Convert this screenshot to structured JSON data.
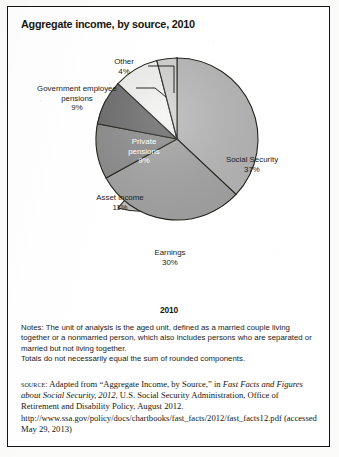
{
  "figure": {
    "title": "Aggregate income, by source, 2010",
    "year_caption": "2010"
  },
  "chart_data": {
    "type": "pie",
    "title": "Aggregate income, by source, 2010",
    "xlabel": "",
    "ylabel": "",
    "legend_position": "none",
    "grid": false,
    "unit": "percent",
    "categories": [
      "Social Security",
      "Earnings",
      "Asset income",
      "Private pensions",
      "Government employee pensions",
      "Other"
    ],
    "values": [
      37,
      30,
      11,
      9,
      9,
      4
    ],
    "slices": [
      {
        "label": "Social Security",
        "value": 37,
        "value_text": "37%",
        "label_line1": "Social Security",
        "label_line2": "37%",
        "label_placement": "inside",
        "color": "#b9b9b9",
        "text_color": "#1c1c18",
        "start_deg": 0,
        "end_deg": 133.2
      },
      {
        "label": "Earnings",
        "value": 30,
        "value_text": "30%",
        "label_line1": "Earnings",
        "label_line2": "30%",
        "label_placement": "inside",
        "color": "#a6a6a6",
        "text_color": "#1c1c18",
        "start_deg": 133.2,
        "end_deg": 241.2
      },
      {
        "label": "Asset income",
        "value": 11,
        "value_text": "11%",
        "label_line1": "Asset income",
        "label_line2": "11%",
        "label_placement": "inside-left",
        "color": "#8e8e8e",
        "text_color": "#1c1c18",
        "start_deg": 241.2,
        "end_deg": 280.8
      },
      {
        "label": "Private pensions",
        "value": 9,
        "value_text": "9%",
        "label_line1": "Private",
        "label_line2": "pensions",
        "label_line3": "9%",
        "label_placement": "inside",
        "color": "#6d6d6d",
        "text_color": "#ffffff",
        "start_deg": 280.8,
        "end_deg": 313.2
      },
      {
        "label": "Government employee pensions",
        "value": 9,
        "value_text": "9%",
        "label_line1": "Government employee",
        "label_line2": "pensions",
        "label_line3": "9%",
        "label_placement": "outside-leader",
        "color": "#f4f4f2",
        "text_color": "#1c1c18",
        "start_deg": 313.2,
        "end_deg": 345.6
      },
      {
        "label": "Other",
        "value": 4,
        "value_text": "4%",
        "label_line1": "Other",
        "label_line2": "4%",
        "label_placement": "outside-leader",
        "color": "#d4d4d2",
        "text_color": "#1c1c18",
        "start_deg": 345.6,
        "end_deg": 360
      }
    ]
  },
  "notes": {
    "line1": "Notes: The unit of analysis is the aged unit, defined as a married couple living together or a nonmarried person, which also includes persons who are separated or married but not living together.",
    "line2": "Totals do not necessarily equal the sum of rounded components."
  },
  "source": {
    "prefix": "source:",
    "text_a": " Adapted from “Aggregate Income, by Source,” in ",
    "italic_a": "Fast Facts and Figures about Social Security, 2012",
    "text_b": ", U.S. Social Security Administration, Office of Retirement and Disability Policy, August 2012. http://www.ssa.gov/policy/docs/chartbooks/fast_facts/2012/fast_facts12.pdf (accessed May 29, 2013)"
  }
}
